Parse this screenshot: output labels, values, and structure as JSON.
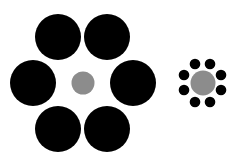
{
  "figure": {
    "colors": {
      "background": "#ffffff",
      "surround": "#000000",
      "center": "#8c8c8c"
    },
    "left_group": {
      "surround_count": 6
    },
    "right_group": {
      "surround_count": 8
    }
  }
}
